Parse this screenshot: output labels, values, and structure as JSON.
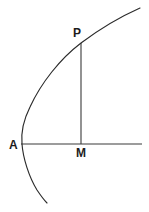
{
  "figure": {
    "background_color": "#ffffff",
    "stroke_color": "#2b2b2b",
    "axis_color": "#3a3a3a",
    "label_color": "#1c1c1c",
    "width": 149,
    "height": 212
  },
  "labels": {
    "vertex": "A",
    "point_on_curve": "P",
    "foot_of_perpendicular": "M"
  },
  "geometry": {
    "curve_name": "parabola",
    "vertex_point": {
      "x": 22,
      "y": 144
    },
    "point_P": {
      "x": 81,
      "y": 43
    },
    "point_M": {
      "x": 81,
      "y": 144
    },
    "axis_line": {
      "x1": 21,
      "y1": 144,
      "x2": 142,
      "y2": 144
    },
    "ordinate_line": {
      "x1": 81,
      "y1": 43,
      "x2": 81,
      "y2": 144
    },
    "curve_upper_end": {
      "x": 140,
      "y": 8
    },
    "curve_lower_end": {
      "x": 47,
      "y": 203
    },
    "curve_path": "M 140 8 C 122 16 101 28 81 43 C 60 59 41 83 30 107 C 23 121 21 134 22 144 C 23 158 29 177 37 190 C 41 196 44 200 47 203"
  }
}
